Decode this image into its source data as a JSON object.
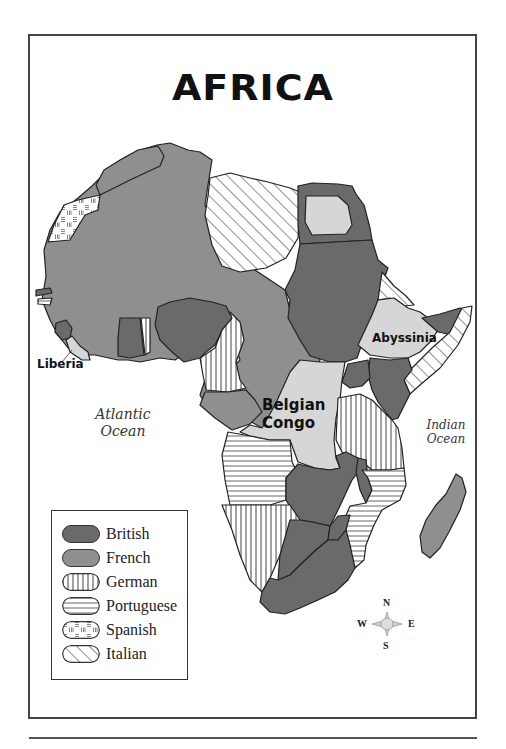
{
  "title": "AFRICA",
  "labels": {
    "liberia": "Liberia",
    "abyssinia": "Abyssinia",
    "belgian_congo_line1": "Belgian",
    "belgian_congo_line2": "Congo"
  },
  "oceans": {
    "atlantic_line1": "Atlantic",
    "atlantic_line2": "Ocean",
    "indian_line1": "Indian",
    "indian_line2": "Ocean"
  },
  "legend": {
    "items": [
      {
        "label": "British",
        "pattern": "solid-dark",
        "color": "#6a6a6a"
      },
      {
        "label": "French",
        "pattern": "solid-medium",
        "color": "#8f8f8f"
      },
      {
        "label": "German",
        "pattern": "vertical-stripes",
        "color": "#ffffff"
      },
      {
        "label": "Portuguese",
        "pattern": "horizontal-stripes",
        "color": "#ffffff"
      },
      {
        "label": "Spanish",
        "pattern": "dashed-grid",
        "color": "#ffffff"
      },
      {
        "label": "Italian",
        "pattern": "diagonal-stripes",
        "color": "#ffffff"
      }
    ]
  },
  "independent_color": "#d6d6d6",
  "compass": {
    "n": "N",
    "s": "S",
    "e": "E",
    "w": "W"
  }
}
